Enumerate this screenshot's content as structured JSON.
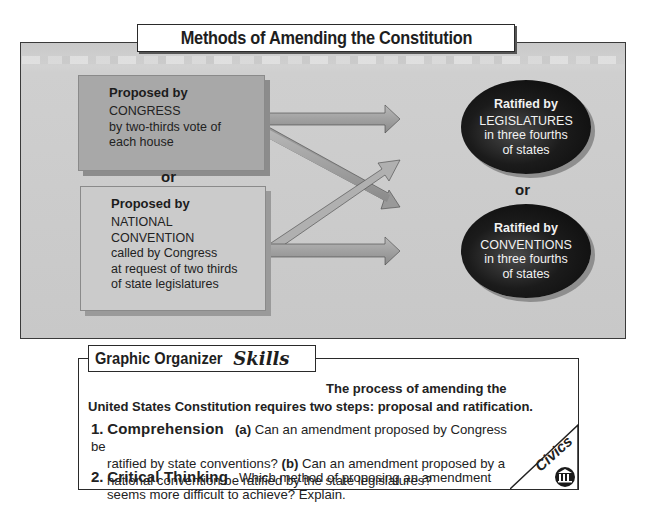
{
  "title": "Methods of Amending the Constitution",
  "proposal": {
    "congress": {
      "heading": "Proposed by",
      "lines": [
        "CONGRESS",
        "by two-thirds vote of",
        "each house"
      ]
    },
    "separator": "or",
    "convention": {
      "heading": "Proposed by",
      "lines": [
        "NATIONAL",
        "CONVENTION",
        "called by Congress",
        "at request of two thirds",
        "of state legislatures"
      ]
    }
  },
  "ratification": {
    "legislatures": {
      "heading": "Ratified by",
      "lines": [
        "LEGISLATURES",
        "in three fourths",
        "of states"
      ]
    },
    "separator": "or",
    "conventions": {
      "heading": "Ratified by",
      "lines": [
        "CONVENTIONS",
        "in three fourths",
        "of states"
      ]
    }
  },
  "arrows": [
    {
      "from": "congress",
      "to": "legislatures"
    },
    {
      "from": "congress",
      "to": "conventions"
    },
    {
      "from": "convention",
      "to": "legislatures"
    },
    {
      "from": "convention",
      "to": "conventions"
    }
  ],
  "skills": {
    "tab_bold": "Graphic Organizer",
    "tab_script": "Skills",
    "intro_line1": "The process of amending the",
    "intro_line2": "United States Constitution requires two steps: proposal and ratification.",
    "questions": [
      {
        "number": "1.",
        "label": "Comprehension",
        "part_a": "(a)",
        "text_a_line1": "Can an amendment proposed by Congress be",
        "text_a_line2": "ratified by state conventions?",
        "part_b": "(b)",
        "text_b_line1": "Can an amendment proposed by a",
        "text_b_line2": "national convention be ratified by the state legislatures?"
      },
      {
        "number": "2.",
        "label": "Critical Thinking",
        "text_line1": "Which method of proposing an amendment",
        "text_line2": "seems more difficult to achieve? Explain."
      }
    ],
    "badge": {
      "label": "Civics",
      "icon": "capitol-columns-icon"
    }
  }
}
